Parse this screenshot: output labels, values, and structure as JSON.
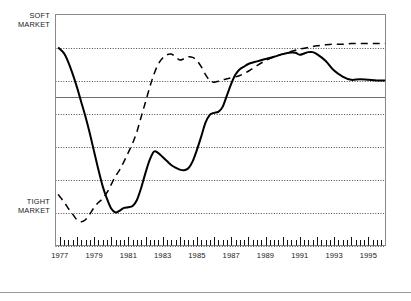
{
  "labels": {
    "soft_market": "SOFT\nMARKET",
    "tight_market": "TIGHT\nMARKET"
  },
  "legend": {
    "items": [
      {
        "label": "Riverside-San Bernardino MSA",
        "style": "solid",
        "color": "#000000"
      },
      {
        "label": "Seattle MSA",
        "style": "dashed",
        "color": "#000000"
      }
    ]
  },
  "chart_data": {
    "type": "line",
    "title": "",
    "subtitle": "",
    "xlabel": "",
    "ylabel": "",
    "ylim": [
      0,
      7
    ],
    "xlim": [
      1976.75,
      1996.0
    ],
    "grid": true,
    "grid_orientation": "horizontal",
    "gridline_values": [
      6,
      5,
      4,
      3,
      2,
      1,
      0
    ],
    "zero_line_value": 4.5,
    "y_annotations": [
      {
        "value": 6.6,
        "text": "SOFT MARKET"
      },
      {
        "value": 1.35,
        "text": "TIGHT MARKET"
      }
    ],
    "legend_position": "bottom",
    "x_tick_interval": 0.25,
    "x_tick_labels": [
      "1977",
      "1979",
      "1981",
      "1983",
      "1985",
      "1987",
      "1989",
      "1991",
      "1993",
      "1995"
    ],
    "x_tick_label_values": [
      1977,
      1979,
      1981,
      1983,
      1985,
      1987,
      1989,
      1991,
      1993,
      1995
    ],
    "series": [
      {
        "name": "Riverside-San Bernardino MSA",
        "style": "solid",
        "color": "#000000",
        "x": [
          1976.9,
          1977.25,
          1977.5,
          1977.75,
          1978.0,
          1978.25,
          1978.5,
          1978.75,
          1979.0,
          1979.25,
          1979.5,
          1979.75,
          1980.0,
          1980.25,
          1980.5,
          1980.75,
          1981.0,
          1981.25,
          1981.5,
          1981.75,
          1982.0,
          1982.25,
          1982.5,
          1982.75,
          1983.0,
          1983.25,
          1983.5,
          1983.75,
          1984.0,
          1984.25,
          1984.5,
          1984.75,
          1985.0,
          1985.25,
          1985.5,
          1985.75,
          1986.0,
          1986.25,
          1986.5,
          1986.75,
          1987.0,
          1987.25,
          1987.5,
          1987.75,
          1988.0,
          1988.5,
          1989.0,
          1989.5,
          1990.0,
          1990.5,
          1990.75,
          1991.0,
          1991.25,
          1991.5,
          1991.75,
          1992.0,
          1992.5,
          1993.0,
          1993.5,
          1994.0,
          1994.5,
          1995.0,
          1995.5,
          1996.0
        ],
        "y": [
          6.0,
          5.82,
          5.55,
          5.2,
          4.8,
          4.35,
          3.9,
          3.4,
          2.85,
          2.3,
          1.8,
          1.42,
          1.12,
          1.0,
          1.06,
          1.14,
          1.16,
          1.2,
          1.38,
          1.75,
          2.2,
          2.6,
          2.85,
          2.8,
          2.68,
          2.56,
          2.44,
          2.36,
          2.3,
          2.28,
          2.34,
          2.55,
          2.9,
          3.3,
          3.72,
          3.96,
          4.02,
          4.05,
          4.2,
          4.55,
          4.9,
          5.18,
          5.34,
          5.42,
          5.5,
          5.58,
          5.65,
          5.72,
          5.8,
          5.85,
          5.84,
          5.78,
          5.82,
          5.86,
          5.86,
          5.8,
          5.6,
          5.3,
          5.12,
          5.02,
          5.04,
          5.02,
          5.0,
          5.0
        ]
      },
      {
        "name": "Seattle MSA",
        "style": "dashed",
        "color": "#000000",
        "x": [
          1976.9,
          1977.25,
          1977.5,
          1977.75,
          1978.0,
          1978.25,
          1978.5,
          1978.75,
          1979.0,
          1979.25,
          1979.5,
          1979.75,
          1980.0,
          1980.25,
          1980.5,
          1980.75,
          1981.0,
          1981.25,
          1981.5,
          1981.75,
          1982.0,
          1982.25,
          1982.5,
          1982.75,
          1983.0,
          1983.25,
          1983.5,
          1983.75,
          1984.0,
          1984.25,
          1984.5,
          1984.75,
          1985.0,
          1985.25,
          1985.5,
          1985.75,
          1986.0,
          1986.25,
          1986.5,
          1986.75,
          1987.0,
          1987.5,
          1988.0,
          1988.5,
          1989.0,
          1989.5,
          1990.0,
          1990.5,
          1991.0,
          1991.5,
          1992.0,
          1992.5,
          1993.0,
          1993.5,
          1994.0,
          1994.5,
          1995.0,
          1995.5,
          1996.0
        ],
        "y": [
          1.55,
          1.32,
          1.12,
          0.95,
          0.78,
          0.72,
          0.78,
          0.95,
          1.15,
          1.3,
          1.42,
          1.6,
          1.85,
          2.1,
          2.3,
          2.55,
          2.82,
          3.1,
          3.45,
          3.9,
          4.35,
          4.8,
          5.2,
          5.5,
          5.68,
          5.78,
          5.8,
          5.72,
          5.62,
          5.66,
          5.72,
          5.7,
          5.6,
          5.42,
          5.18,
          5.0,
          4.95,
          4.98,
          5.02,
          5.05,
          5.08,
          5.15,
          5.28,
          5.45,
          5.6,
          5.72,
          5.8,
          5.88,
          5.95,
          6.0,
          6.05,
          6.08,
          6.1,
          6.1,
          6.12,
          6.12,
          6.12,
          6.12,
          6.12
        ]
      }
    ]
  }
}
